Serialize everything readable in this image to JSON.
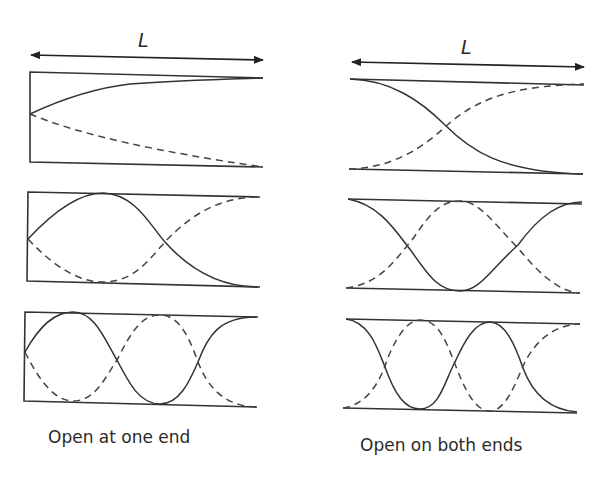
{
  "figure": {
    "left_panel": {
      "length_label": "L",
      "caption": "Open at one end",
      "modes": [
        {
          "name": "fundamental",
          "quarter_wavelengths": 1
        },
        {
          "name": "third-harmonic",
          "quarter_wavelengths": 3
        },
        {
          "name": "fifth-harmonic",
          "quarter_wavelengths": 5
        }
      ]
    },
    "right_panel": {
      "length_label": "L",
      "caption": "Open on both ends",
      "modes": [
        {
          "name": "fundamental",
          "half_wavelengths": 1
        },
        {
          "name": "second-harmonic",
          "half_wavelengths": 2
        },
        {
          "name": "third-harmonic",
          "half_wavelengths": 3
        }
      ]
    },
    "legend": {
      "solid_line": "displacement (one extreme)",
      "dashed_line": "displacement (opposite extreme)"
    }
  }
}
